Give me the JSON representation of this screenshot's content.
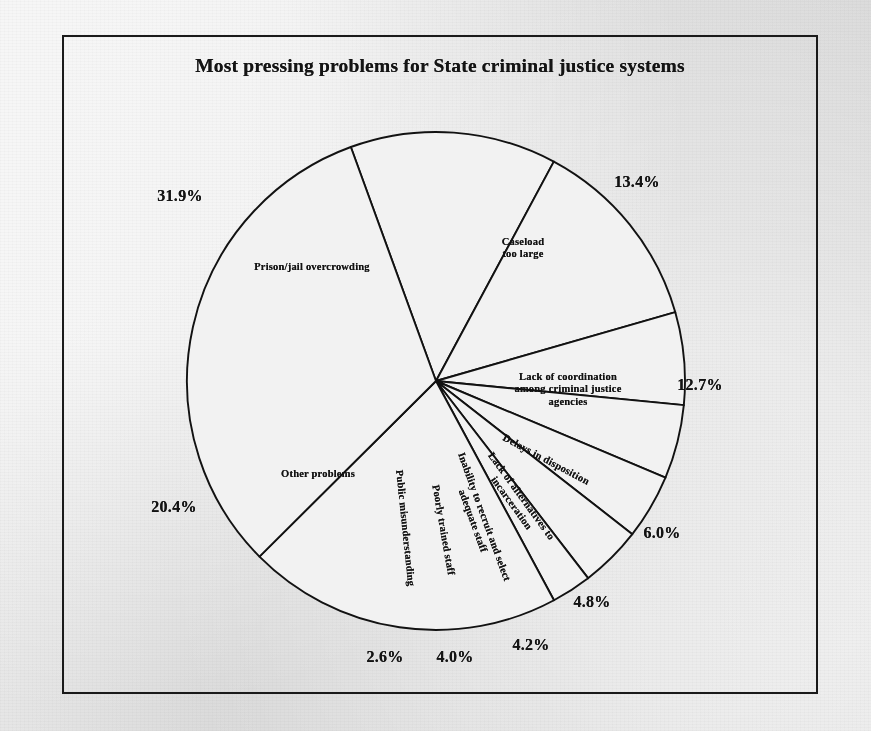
{
  "document": {
    "title": "Most pressing problems for State criminal justice systems",
    "background_color": "#e8e8e8",
    "frame_color": "#1a1a1a",
    "pie_fill_color": "#f2f2f2",
    "pie_line_color": "#121212"
  },
  "chart_data": {
    "type": "pie",
    "title": "Most pressing problems for State criminal justice systems",
    "xlabel": "",
    "ylabel": "",
    "units": "percent",
    "legend_position": "none",
    "grid": false,
    "total": 100.0,
    "categories": [
      "Caseload too large",
      "Lack of coordination among criminal justice agencies",
      "Delays in disposition",
      "Lack of alternatives to incarceration",
      "Inability to recruit and select adequate staff",
      "Poorly trained staff",
      "Public misunderstanding",
      "Other problems",
      "Prison/jail overcrowding"
    ],
    "values": [
      13.4,
      12.7,
      6.0,
      4.8,
      4.2,
      4.0,
      2.6,
      20.4,
      31.9
    ],
    "labels": [
      "13.4%",
      "12.7%",
      "6.0%",
      "4.8%",
      "4.2%",
      "4.0%",
      "2.6%",
      "20.4%",
      "31.9%"
    ],
    "slices": [
      {
        "name": "Caseload too large",
        "label": "Caseload\ntoo large",
        "value": 13.4,
        "pct_label": "13.4%",
        "label_x": 523,
        "label_y": 248,
        "label_rotation": 0,
        "pct_x": 637,
        "pct_y": 182
      },
      {
        "name": "Lack of coordination among criminal justice agencies",
        "label": "Lack of coordination\namong criminal justice\nagencies",
        "value": 12.7,
        "pct_label": "12.7%",
        "label_x": 568,
        "label_y": 390,
        "label_rotation": 0,
        "pct_x": 700,
        "pct_y": 385
      },
      {
        "name": "Delays in disposition",
        "label": "Delays in disposition",
        "value": 6.0,
        "pct_label": "6.0%",
        "label_x": 546,
        "label_y": 460,
        "label_rotation": 28,
        "pct_x": 662,
        "pct_y": 533
      },
      {
        "name": "Lack of alternatives to incarceration",
        "label": "Lack of alternatives to\nincarceration",
        "value": 4.8,
        "pct_label": "4.8%",
        "label_x": 516,
        "label_y": 500,
        "label_rotation": 54,
        "pct_x": 592,
        "pct_y": 602
      },
      {
        "name": "Inability to recruit and select adequate staff",
        "label": "Inability to recruit and select\nadequate staff",
        "value": 4.2,
        "pct_label": "4.2%",
        "label_x": 478,
        "label_y": 519,
        "label_rotation": 70,
        "pct_x": 531,
        "pct_y": 645
      },
      {
        "name": "Poorly trained staff",
        "label": "Poorly trained staff",
        "value": 4.0,
        "pct_label": "4.0%",
        "label_x": 443,
        "label_y": 530,
        "label_rotation": 80,
        "pct_x": 455,
        "pct_y": 657
      },
      {
        "name": "Public misunderstanding",
        "label": "Public misunderstanding",
        "value": 2.6,
        "pct_label": "2.6%",
        "label_x": 405,
        "label_y": 528,
        "label_rotation": 84,
        "pct_x": 385,
        "pct_y": 657
      },
      {
        "name": "Other problems",
        "label": "Other problems",
        "value": 20.4,
        "pct_label": "20.4%",
        "label_x": 318,
        "label_y": 474,
        "label_rotation": 0,
        "pct_x": 174,
        "pct_y": 507
      },
      {
        "name": "Prison/jail overcrowding",
        "label": "Prison/jail overcrowding",
        "value": 31.9,
        "pct_label": "31.9%",
        "label_x": 312,
        "label_y": 267,
        "label_rotation": 0,
        "pct_x": 180,
        "pct_y": 196
      }
    ],
    "geometry": {
      "center_x": 436,
      "center_y": 381,
      "radius": 249,
      "start_angle_deg": -20,
      "direction": "clockwise"
    }
  }
}
